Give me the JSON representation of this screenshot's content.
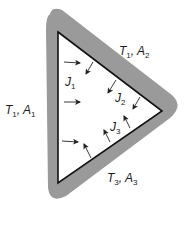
{
  "figure": {
    "colors": {
      "band": "#9a9a9a",
      "enclosure_fill": "#ffffff",
      "edge": "#111111",
      "arrow": "#222222",
      "text": "#1a1a1a"
    },
    "surface_labels": [
      {
        "id": "surface-1",
        "symbol": "T",
        "t_sub": "1",
        "area": "A",
        "a_sub": "1",
        "sep": ", "
      },
      {
        "id": "surface-2",
        "symbol": "T",
        "t_sub": "1",
        "area": "A",
        "a_sub": "2",
        "sep": ", "
      },
      {
        "id": "surface-3",
        "symbol": "T",
        "t_sub": "3",
        "area": "A",
        "a_sub": "3",
        "sep": ", "
      }
    ],
    "radiosity_labels": [
      {
        "id": "J1",
        "symbol": "J",
        "sub": "1"
      },
      {
        "id": "J2",
        "symbol": "J",
        "sub": "2"
      },
      {
        "id": "J3",
        "symbol": "J",
        "sub": "3"
      }
    ]
  }
}
